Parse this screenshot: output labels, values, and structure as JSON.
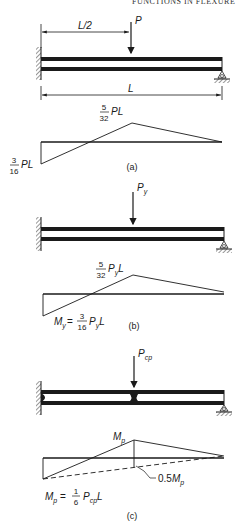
{
  "header": {
    "text": "FUNCTIONS IN FLEXURE"
  },
  "panels": [
    {
      "id": "a",
      "caption": "(a)",
      "load_label": "P",
      "half_span_label": "L/2",
      "span_label": "L",
      "moment_peak": {
        "num": "5",
        "den": "32",
        "suffix": "PL"
      },
      "moment_fixed": {
        "num": "3",
        "den": "16",
        "suffix": "PL"
      }
    },
    {
      "id": "b",
      "caption": "(b)",
      "load_label": "P",
      "load_sub": "y",
      "moment_peak": {
        "num": "5",
        "den": "32",
        "pre": "P",
        "sub": "y",
        "post": "L"
      },
      "moment_fixed": {
        "prefix": "M",
        "prefix_sub": "y",
        "eq": "=",
        "num": "3",
        "den": "16",
        "pre": "P",
        "sub": "y",
        "post": "L"
      }
    },
    {
      "id": "c",
      "caption": "(c)",
      "load_label": "P",
      "load_sub": "cp",
      "moment_peak": {
        "pre": "M",
        "sub": "p"
      },
      "redistribution_label": {
        "value": "0.5",
        "pre": "M",
        "sub": "p"
      },
      "moment_fixed": {
        "prefix": "M",
        "prefix_sub": "p",
        "eq": "=",
        "num": "1",
        "den": "6",
        "pre": "P",
        "sub": "cp",
        "post": "L"
      }
    }
  ]
}
